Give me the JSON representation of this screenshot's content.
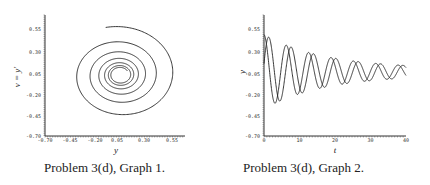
{
  "figures": [
    {
      "id": "graph1",
      "caption": "Problem 3(d), Graph 1.",
      "xlabel": "y",
      "ylabel": "v = y′"
    },
    {
      "id": "graph2",
      "caption": "Problem 3(d), Graph 2.",
      "xlabel": "t",
      "ylabel": "y"
    }
  ],
  "chart_data": [
    {
      "type": "line",
      "title": "Problem 3(d), Graph 1.",
      "subtype": "phase-portrait spiral",
      "xlabel": "y",
      "ylabel": "v = y′",
      "xlim": [
        -0.7,
        0.7
      ],
      "ylim": [
        -0.7,
        0.7
      ],
      "xticks": [
        "-0.70",
        "-0.45",
        "-0.20",
        "0.05",
        "0.30",
        "0.55"
      ],
      "yticks": [
        "-0.70",
        "-0.45",
        "-0.20",
        "0.05",
        "0.30",
        "0.55"
      ],
      "grid": false,
      "series": [
        {
          "name": "trajectory",
          "description": "Inward spiral converging to approximately (0.05, 0.05)",
          "start": [
            0.0,
            0.5
          ],
          "end": [
            0.05,
            0.05
          ]
        }
      ]
    },
    {
      "type": "line",
      "title": "Problem 3(d), Graph 2.",
      "xlabel": "t",
      "ylabel": "y",
      "xlim": [
        0,
        40
      ],
      "ylim": [
        -0.7,
        0.7
      ],
      "xticks": [
        "0",
        "10",
        "20",
        "30",
        "40"
      ],
      "yticks": [
        "-0.70",
        "-0.45",
        "-0.20",
        "0.05",
        "0.30",
        "0.55"
      ],
      "grid": false,
      "series": [
        {
          "name": "y(t) solution 1",
          "description": "Damped oscillation, starts ~0.45, first min ~-0.40 at t≈3, decays toward ~0.05"
        },
        {
          "name": "y(t) solution 2",
          "description": "Damped oscillation phase-shifted ~1.3 time units, peak ~0.45 at t≈1.5, decays toward ~0.05"
        }
      ],
      "x": [
        0,
        5,
        10,
        15,
        20,
        25,
        30,
        35,
        40
      ]
    }
  ]
}
